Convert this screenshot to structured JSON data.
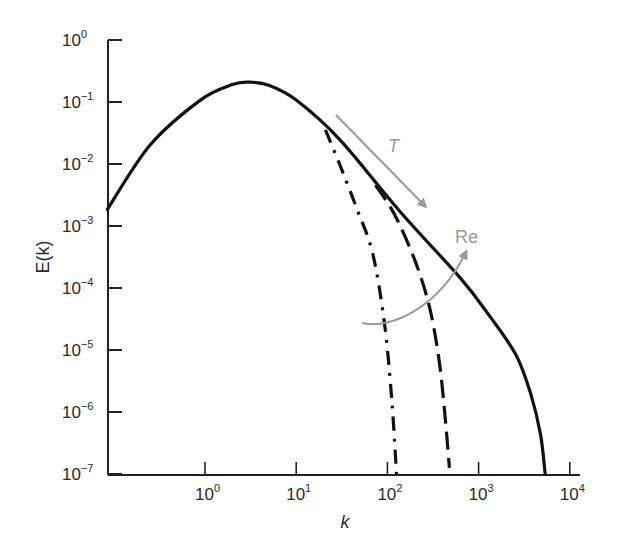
{
  "chart_data": {
    "type": "line",
    "title": "",
    "xlabel": "k",
    "ylabel": "E(k)",
    "xscale": "log",
    "yscale": "log",
    "xlim": [
      0.085,
      10000
    ],
    "ylim": [
      1e-07,
      1
    ],
    "grid": false,
    "x_ticks": [
      {
        "base": "10",
        "exp": "0",
        "value": 1
      },
      {
        "base": "10",
        "exp": "1",
        "value": 10
      },
      {
        "base": "10",
        "exp": "2",
        "value": 100
      },
      {
        "base": "10",
        "exp": "3",
        "value": 1000
      },
      {
        "base": "10",
        "exp": "4",
        "value": 10000
      }
    ],
    "y_ticks": [
      {
        "base": "10",
        "exp": "0",
        "value": 1
      },
      {
        "base": "10",
        "exp": "−1",
        "value": 0.1
      },
      {
        "base": "10",
        "exp": "−2",
        "value": 0.01
      },
      {
        "base": "10",
        "exp": "−3",
        "value": 0.001
      },
      {
        "base": "10",
        "exp": "−4",
        "value": 0.0001
      },
      {
        "base": "10",
        "exp": "−5",
        "value": 1e-05
      },
      {
        "base": "10",
        "exp": "−6",
        "value": 1e-06
      },
      {
        "base": "10",
        "exp": "−7",
        "value": 1e-07
      }
    ],
    "series": [
      {
        "name": "highest Re (solid)",
        "style": "solid",
        "color": "#111111",
        "log10_k": [
          -1.07,
          -0.6,
          -0.05,
          0.3,
          0.49,
          0.7,
          1.0,
          1.48,
          2.14,
          2.8,
          3.12,
          3.41,
          3.57,
          3.68,
          3.73
        ],
        "log10_E": [
          -2.73,
          -1.69,
          -0.97,
          -0.72,
          -0.68,
          -0.73,
          -0.97,
          -1.61,
          -2.77,
          -3.84,
          -4.45,
          -5.08,
          -5.7,
          -6.37,
          -7.0
        ]
      },
      {
        "name": "intermediate Re (dashed)",
        "style": "dashed",
        "color": "#111111",
        "log10_k": [
          1.87,
          2.08,
          2.3,
          2.46,
          2.57,
          2.64,
          2.68
        ],
        "log10_E": [
          -2.34,
          -2.82,
          -3.55,
          -4.3,
          -5.2,
          -6.2,
          -6.9
        ]
      },
      {
        "name": "lowest Re (dash-dot)",
        "style": "dashdot",
        "color": "#111111",
        "log10_k": [
          1.32,
          1.48,
          1.67,
          1.84,
          1.97,
          2.05,
          2.1
        ],
        "log10_E": [
          -1.45,
          -2.02,
          -2.74,
          -3.45,
          -4.6,
          -5.85,
          -7.0
        ]
      }
    ],
    "annotations": [
      {
        "label": "T",
        "type": "arrow",
        "color": "#9a9a9a",
        "from_px": [
          336,
          115
        ],
        "to_px": [
          425,
          206
        ],
        "label_px": [
          388,
          152
        ],
        "italic": true
      },
      {
        "label": "Re",
        "type": "curved-arrow",
        "color": "#9a9a9a",
        "path_px": [
          [
            362,
            323
          ],
          [
            392,
            330
          ],
          [
            440,
            306
          ],
          [
            466,
            252
          ]
        ],
        "label_px": [
          455,
          243
        ],
        "italic": false
      }
    ]
  }
}
